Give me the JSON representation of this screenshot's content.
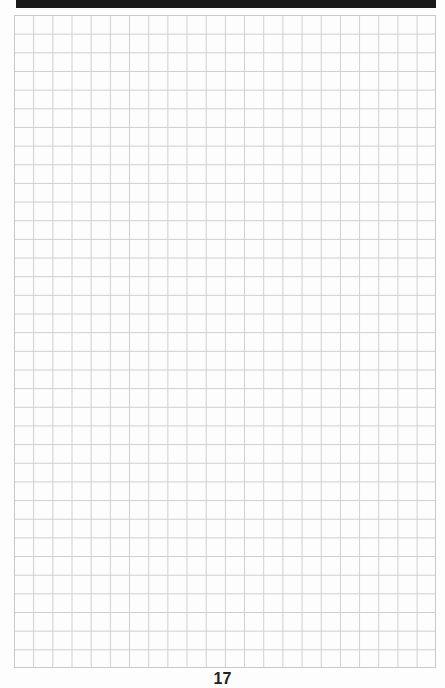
{
  "page": {
    "type": "graph-paper",
    "grid": {
      "columns": 22,
      "rows": 35,
      "line_color": "#cfcfcf"
    },
    "header_bar_color": "#1a1a1a",
    "page_number": "17"
  }
}
